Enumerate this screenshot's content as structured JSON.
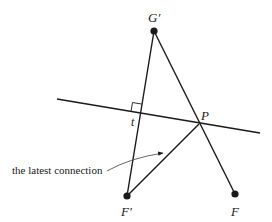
{
  "diagram": {
    "points": {
      "G_prime": {
        "label": "G′",
        "x": 154,
        "y": 31
      },
      "F_prime": {
        "label": "F′",
        "x": 127,
        "y": 196
      },
      "F": {
        "label": "F",
        "x": 235,
        "y": 194
      },
      "P": {
        "label": "P",
        "x": 199,
        "y": 124
      },
      "t": {
        "label": "t",
        "x": 140,
        "y": 113
      }
    },
    "annotation": "the latest connection",
    "colors": {
      "stroke": "#1a1a1a",
      "arrow": "#555555"
    }
  }
}
